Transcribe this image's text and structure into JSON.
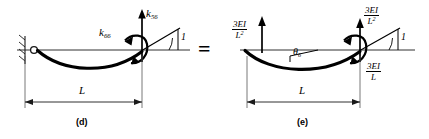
{
  "figure": {
    "title_panels": [
      "(d)",
      "(e)"
    ],
    "equals_symbol": "=",
    "panel_d": {
      "caption": "(d)",
      "dimension_label": "L",
      "force_label": "k",
      "force_subscript": "56",
      "moment_label": "k",
      "moment_subscript": "66",
      "unit_rotation_label": "1",
      "support_type": "pinned-support",
      "beam_shape": "sagging-curve"
    },
    "panel_e": {
      "caption": "(e)",
      "dimension_label": "L",
      "left_shear": {
        "numerator": "3EI",
        "denominator": "L",
        "denominator_exp": "2"
      },
      "right_shear": {
        "numerator": "3EI",
        "denominator": "L",
        "denominator_exp": "2"
      },
      "right_moment": {
        "numerator": "3EI",
        "denominator": "L",
        "denominator_exp": ""
      },
      "rotation_label": "θ",
      "rotation_subscript": "6",
      "unit_rotation_label": "1",
      "support_type": "pinned-support",
      "beam_shape": "sagging-curve"
    }
  },
  "colors": {
    "ink": "#000000",
    "background": "#ffffff",
    "thin_line": "#333333"
  }
}
